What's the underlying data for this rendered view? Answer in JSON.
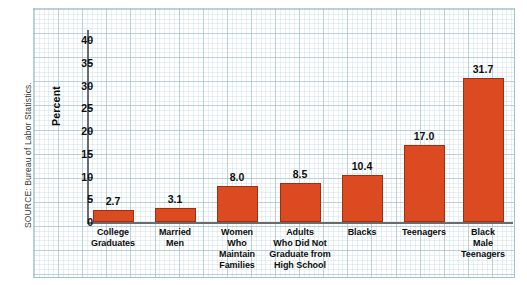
{
  "figure": {
    "source_note": "SOURCE: Bureau of Labor Statistics."
  },
  "chart_data": {
    "type": "bar",
    "title": "",
    "subtitle": "",
    "xlabel": "",
    "ylabel": "Percent",
    "ylim": [
      0,
      42
    ],
    "yticks": [
      0,
      5,
      10,
      15,
      20,
      25,
      30,
      35,
      40
    ],
    "ytick_labels": [
      "0",
      "5",
      "10",
      "15",
      "20",
      "25",
      "30",
      "35",
      "40"
    ],
    "grid": true,
    "grid_style": "graph-paper",
    "legend": "none",
    "bar_color": "#DB4A20",
    "bar_edge_color": "#9E2F12",
    "categories": [
      "College Graduates",
      "Married Men",
      "Women Who Maintain Families",
      "Adults Who Did Not Graduate from High School",
      "Blacks",
      "Teenagers",
      "Black Male Teenagers"
    ],
    "category_label_lines": [
      [
        "College",
        "Graduates"
      ],
      [
        "Married",
        "Men"
      ],
      [
        "Women",
        "Who",
        "Maintain",
        "Families"
      ],
      [
        "Adults",
        "Who Did Not",
        "Graduate from",
        "High School"
      ],
      [
        "Blacks"
      ],
      [
        "Teenagers"
      ],
      [
        "Black",
        "Male",
        "Teenagers"
      ]
    ],
    "values": [
      2.7,
      3.1,
      8.0,
      8.5,
      10.4,
      17.0,
      31.7
    ],
    "value_labels": [
      "2.7",
      "3.1",
      "8.0",
      "8.5",
      "10.4",
      "17.0",
      "31.7"
    ]
  }
}
